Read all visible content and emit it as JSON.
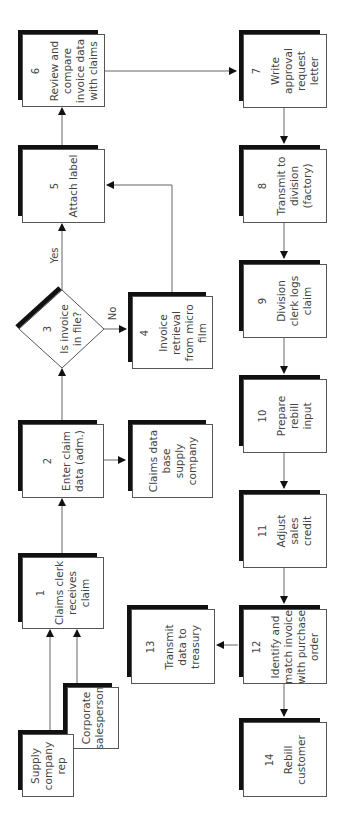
{
  "diagram": {
    "orientation": "rotated-90-ccw",
    "colors": {
      "box_border": "#555555",
      "box_shadow": "#111111",
      "text": "#444444",
      "line": "#666666"
    },
    "nodes": [
      {
        "id": "1",
        "number": "1",
        "label": "Claims clerk\nreceives\nclaim"
      },
      {
        "id": "2",
        "number": "2",
        "label": "Enter claim\ndata (adm.)"
      },
      {
        "id": "3",
        "number": "3",
        "label": "Is invoice\nin file?",
        "shape": "diamond"
      },
      {
        "id": "4",
        "number": "4",
        "label": "Invoice\nretrieval\nfrom micro\nfilm"
      },
      {
        "id": "5",
        "number": "5",
        "label": "Attach label"
      },
      {
        "id": "6",
        "number": "6",
        "label": "Review and\ncompare\ninvoice data\nwith claims"
      },
      {
        "id": "7",
        "number": "7",
        "label": "Write\napproval\nrequest\nletter"
      },
      {
        "id": "8",
        "number": "8",
        "label": "Transmit to\ndivision\n(factory)"
      },
      {
        "id": "9",
        "number": "9",
        "label": "Division\nclerk logs\nclaim"
      },
      {
        "id": "10",
        "number": "10",
        "label": "Prepare\nrebill\ninput"
      },
      {
        "id": "11",
        "number": "11",
        "label": "Adjust\nsales\ncredit"
      },
      {
        "id": "12",
        "number": "12",
        "label": "Identify and\nmatch invoice\nwith purchase\norder"
      },
      {
        "id": "13",
        "number": "13",
        "label": "Transmit\ndata to\ntreasury"
      },
      {
        "id": "14",
        "number": "14",
        "label": "Rebill\ncustomer"
      },
      {
        "id": "db",
        "number": "",
        "label": "Claims data\nbase\nsupply\ncompany"
      },
      {
        "id": "rep",
        "number": "",
        "label": "Supply\ncompany\nrep"
      },
      {
        "id": "sales",
        "number": "",
        "label": "Corporate\nsalesperson"
      }
    ],
    "edges": [
      {
        "from": "rep",
        "to": "1"
      },
      {
        "from": "sales",
        "to": "1"
      },
      {
        "from": "1",
        "to": "2"
      },
      {
        "from": "2",
        "to": "3"
      },
      {
        "from": "2",
        "to": "db"
      },
      {
        "from": "3",
        "to": "5",
        "label": "Yes"
      },
      {
        "from": "3",
        "to": "4",
        "label": "No"
      },
      {
        "from": "4",
        "to": "5"
      },
      {
        "from": "5",
        "to": "6"
      },
      {
        "from": "6",
        "to": "7"
      },
      {
        "from": "7",
        "to": "8"
      },
      {
        "from": "8",
        "to": "9"
      },
      {
        "from": "9",
        "to": "10"
      },
      {
        "from": "10",
        "to": "11"
      },
      {
        "from": "11",
        "to": "12"
      },
      {
        "from": "12",
        "to": "13"
      },
      {
        "from": "12",
        "to": "14"
      }
    ],
    "edge_labels": {
      "yes": "Yes",
      "no": "No"
    }
  }
}
